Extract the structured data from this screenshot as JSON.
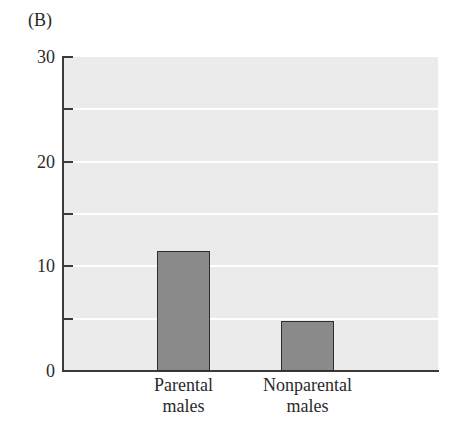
{
  "panel_label": "(B)",
  "colors": {
    "plot_background": "#ebebeb",
    "bar_fill": "#8a8a8a",
    "bar_border": "#2e2e2e",
    "gridline": "#ffffff",
    "axis": "#3a3a3a"
  },
  "chart_data": {
    "type": "bar",
    "title": "",
    "categories": [
      "Parental males",
      "Nonparental males"
    ],
    "category_label_lines": [
      [
        "Parental",
        "males"
      ],
      [
        "Nonparental",
        "males"
      ]
    ],
    "values": [
      11.5,
      4.8
    ],
    "xlabel": "",
    "ylabel": "",
    "ylim": [
      0,
      30
    ],
    "yticks_labeled": [
      0,
      10,
      20,
      30
    ],
    "yticks_minor": [
      5,
      15,
      25
    ],
    "gridlines": [
      5,
      10,
      15,
      20,
      25
    ],
    "grid": true,
    "legend": null
  }
}
